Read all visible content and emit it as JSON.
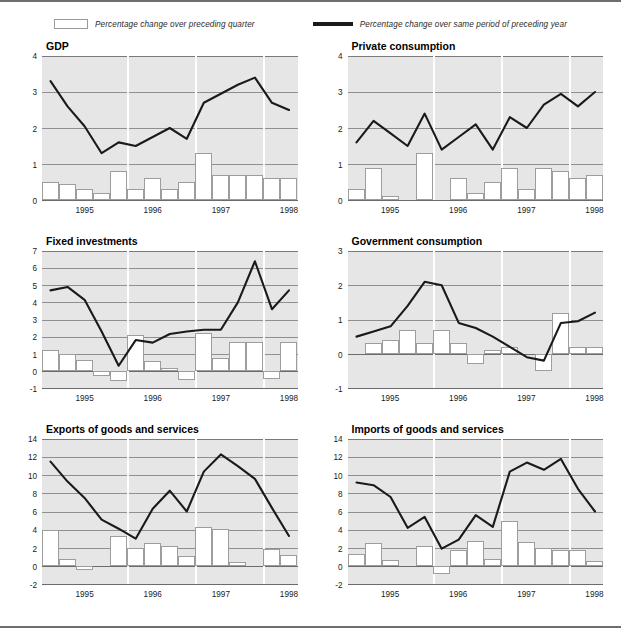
{
  "legend": {
    "bar_label": "Percentage change over preceding quarter",
    "line_label": "Percentage change over same period of preceding year",
    "bar_fill": "#ffffff",
    "bar_border": "#9d9d9d",
    "line_color": "#1a1a1a"
  },
  "axis": {
    "years": [
      "1995",
      "1996",
      "1997",
      "1998"
    ]
  },
  "chart_data": [
    {
      "type": "bar",
      "title": "GDP",
      "xlabel": "",
      "ylabel": "",
      "ylim": [
        0,
        4
      ],
      "yticks": [
        0,
        1,
        2,
        3,
        4
      ],
      "grid": true,
      "legend_position": "top-center",
      "categories": [
        "1994Q4",
        "1995Q1",
        "1995Q2",
        "1995Q3",
        "1995Q4",
        "1996Q1",
        "1996Q2",
        "1996Q3",
        "1996Q4",
        "1997Q1",
        "1997Q2",
        "1997Q3",
        "1997Q4",
        "1998Q1"
      ],
      "xticklabels": [
        "1995",
        "1996",
        "1997",
        "1998"
      ],
      "series": [
        {
          "name": "Percentage change over preceding quarter",
          "kind": "bar",
          "values": [
            0.5,
            0.45,
            0.3,
            0.2,
            0.8,
            0.3,
            0.6,
            0.3,
            0.5,
            1.3,
            0.7,
            0.7,
            0.7,
            0.6,
            0.6
          ]
        },
        {
          "name": "Percentage change over same period of preceding year",
          "kind": "line",
          "values": [
            3.3,
            2.6,
            2.05,
            1.3,
            1.6,
            1.5,
            1.75,
            2.0,
            1.7,
            2.7,
            2.95,
            3.2,
            3.4,
            2.7,
            2.5
          ]
        }
      ]
    },
    {
      "type": "bar",
      "title": "Private consumption",
      "xlabel": "",
      "ylabel": "",
      "ylim": [
        0,
        4
      ],
      "yticks": [
        0,
        1,
        2,
        3,
        4
      ],
      "grid": true,
      "legend_position": "top-center",
      "categories": [
        "1994Q4",
        "1995Q1",
        "1995Q2",
        "1995Q3",
        "1995Q4",
        "1996Q1",
        "1996Q2",
        "1996Q3",
        "1996Q4",
        "1997Q1",
        "1997Q2",
        "1997Q3",
        "1997Q4",
        "1998Q1"
      ],
      "xticklabels": [
        "1995",
        "1996",
        "1997",
        "1998"
      ],
      "series": [
        {
          "name": "Percentage change over preceding quarter",
          "kind": "bar",
          "values": [
            0.3,
            0.9,
            0.1,
            0.0,
            1.3,
            0.0,
            0.6,
            0.2,
            0.5,
            0.9,
            0.3,
            0.9,
            0.8,
            0.6,
            0.7
          ]
        },
        {
          "name": "Percentage change over same period of preceding year",
          "kind": "line",
          "values": [
            1.6,
            2.2,
            1.85,
            1.5,
            2.4,
            1.4,
            1.75,
            2.1,
            1.4,
            2.3,
            2.0,
            2.65,
            2.95,
            2.6,
            3.0
          ]
        }
      ]
    },
    {
      "type": "bar",
      "title": "Fixed investments",
      "xlabel": "",
      "ylabel": "",
      "ylim": [
        -1,
        7
      ],
      "yticks": [
        -1,
        0,
        1,
        2,
        3,
        4,
        5,
        6,
        7
      ],
      "grid": true,
      "legend_position": "top-center",
      "categories": [
        "1994Q4",
        "1995Q1",
        "1995Q2",
        "1995Q3",
        "1995Q4",
        "1996Q1",
        "1996Q2",
        "1996Q3",
        "1996Q4",
        "1997Q1",
        "1997Q2",
        "1997Q3",
        "1997Q4",
        "1998Q1"
      ],
      "xticklabels": [
        "1995",
        "1996",
        "1997",
        "1998"
      ],
      "series": [
        {
          "name": "Percentage change over preceding quarter",
          "kind": "bar",
          "values": [
            1.2,
            1.0,
            0.65,
            -0.3,
            -0.6,
            2.1,
            0.55,
            0.15,
            -0.55,
            2.2,
            0.75,
            1.7,
            1.7,
            -0.5,
            1.7
          ]
        },
        {
          "name": "Percentage change over same period of preceding year",
          "kind": "line",
          "values": [
            4.7,
            4.9,
            4.15,
            2.3,
            0.3,
            1.8,
            1.65,
            2.15,
            2.3,
            2.4,
            2.4,
            4.0,
            6.4,
            3.6,
            4.7
          ]
        }
      ]
    },
    {
      "type": "bar",
      "title": "Government consumption",
      "xlabel": "",
      "ylabel": "",
      "ylim": [
        -1,
        3
      ],
      "yticks": [
        -1,
        0,
        1,
        2,
        3
      ],
      "grid": true,
      "legend_position": "top-center",
      "categories": [
        "1994Q4",
        "1995Q1",
        "1995Q2",
        "1995Q3",
        "1995Q4",
        "1996Q1",
        "1996Q2",
        "1996Q3",
        "1996Q4",
        "1997Q1",
        "1997Q2",
        "1997Q3",
        "1997Q4",
        "1998Q1"
      ],
      "xticklabels": [
        "1995",
        "1996",
        "1997",
        "1998"
      ],
      "series": [
        {
          "name": "Percentage change over preceding quarter",
          "kind": "bar",
          "values": [
            0.0,
            0.3,
            0.4,
            0.7,
            0.3,
            0.7,
            0.3,
            -0.3,
            0.1,
            0.2,
            0.0,
            -0.5,
            1.2,
            0.2,
            0.2
          ]
        },
        {
          "name": "Percentage change over same period of preceding year",
          "kind": "line",
          "values": [
            0.5,
            0.65,
            0.8,
            1.4,
            2.1,
            2.0,
            0.9,
            0.75,
            0.5,
            0.2,
            -0.1,
            -0.2,
            0.9,
            0.95,
            1.2
          ]
        }
      ]
    },
    {
      "type": "bar",
      "title": "Exports of goods and services",
      "xlabel": "",
      "ylabel": "",
      "ylim": [
        -2,
        14
      ],
      "yticks": [
        -2,
        0,
        2,
        4,
        6,
        8,
        10,
        12,
        14
      ],
      "grid": true,
      "legend_position": "top-center",
      "categories": [
        "1994Q4",
        "1995Q1",
        "1995Q2",
        "1995Q3",
        "1995Q4",
        "1996Q1",
        "1996Q2",
        "1996Q3",
        "1996Q4",
        "1997Q1",
        "1997Q2",
        "1997Q3",
        "1997Q4",
        "1998Q1"
      ],
      "xticklabels": [
        "1995",
        "1996",
        "1997",
        "1998"
      ],
      "series": [
        {
          "name": "Percentage change over preceding quarter",
          "kind": "bar",
          "values": [
            4.0,
            0.8,
            -0.5,
            0.0,
            3.3,
            2.0,
            2.5,
            2.2,
            1.1,
            4.3,
            4.1,
            0.4,
            0.0,
            1.9,
            1.2
          ]
        },
        {
          "name": "Percentage change over same period of preceding year",
          "kind": "line",
          "values": [
            11.5,
            9.3,
            7.5,
            5.1,
            4.1,
            3.0,
            6.3,
            8.3,
            6.0,
            10.4,
            12.3,
            11.0,
            9.6,
            6.4,
            3.3
          ]
        }
      ]
    },
    {
      "type": "bar",
      "title": "Imports of goods and services",
      "xlabel": "",
      "ylabel": "",
      "ylim": [
        -2,
        14
      ],
      "yticks": [
        -2,
        0,
        2,
        4,
        6,
        8,
        10,
        12,
        14
      ],
      "grid": true,
      "legend_position": "top-center",
      "categories": [
        "1994Q4",
        "1995Q1",
        "1995Q2",
        "1995Q3",
        "1995Q4",
        "1996Q1",
        "1996Q2",
        "1996Q3",
        "1996Q4",
        "1997Q1",
        "1997Q2",
        "1997Q3",
        "1997Q4",
        "1998Q1"
      ],
      "xticklabels": [
        "1995",
        "1996",
        "1997",
        "1998"
      ],
      "series": [
        {
          "name": "Percentage change over preceding quarter",
          "kind": "bar",
          "values": [
            1.3,
            2.5,
            0.6,
            0.0,
            2.2,
            -0.9,
            1.8,
            2.8,
            0.8,
            5.0,
            2.6,
            2.0,
            1.8,
            1.75,
            0.5
          ]
        },
        {
          "name": "Percentage change over same period of preceding year",
          "kind": "line",
          "values": [
            9.2,
            8.9,
            7.6,
            4.2,
            5.4,
            1.9,
            2.9,
            5.6,
            4.3,
            10.4,
            11.4,
            10.6,
            11.8,
            8.5,
            6.0
          ]
        }
      ]
    }
  ]
}
